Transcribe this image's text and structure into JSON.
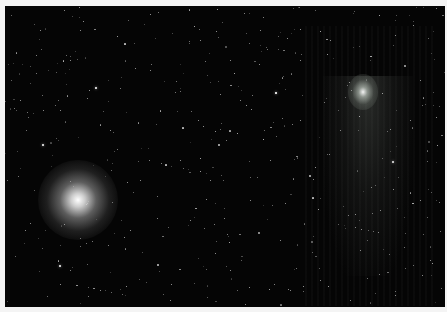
{
  "image": {
    "subject": "Starfield astrophotograph",
    "objects": [
      {
        "name": "globular-cluster",
        "x": 78,
        "y": 200,
        "radius": 34
      },
      {
        "name": "comet",
        "x": 363,
        "y": 88,
        "tail_direction": "down"
      }
    ],
    "colors": {
      "sky": "#050505",
      "frame": "#f4f4f4",
      "star": "#ffffff"
    }
  },
  "stars": [
    [
      43,
      145,
      2.2
    ],
    [
      60,
      266,
      2.2
    ],
    [
      96,
      88,
      1.8
    ],
    [
      276,
      93,
      1.6
    ],
    [
      219,
      145,
      1.4
    ],
    [
      183,
      128,
      1.2
    ],
    [
      310,
      176,
      1.4
    ],
    [
      393,
      162,
      2
    ],
    [
      313,
      198,
      1.2
    ],
    [
      158,
      265,
      1.4
    ],
    [
      125,
      44,
      1.1
    ],
    [
      40,
      30,
      1
    ],
    [
      70,
      60,
      1
    ],
    [
      150,
      70,
      1
    ],
    [
      200,
      40,
      1
    ],
    [
      260,
      30,
      1
    ],
    [
      300,
      60,
      1
    ],
    [
      330,
      40,
      1
    ],
    [
      395,
      35,
      1
    ],
    [
      420,
      80,
      1
    ],
    [
      410,
      120,
      1
    ],
    [
      380,
      210,
      1
    ],
    [
      360,
      250,
      1
    ],
    [
      320,
      280,
      1
    ],
    [
      280,
      240,
      1
    ],
    [
      250,
      200,
      1
    ],
    [
      230,
      270,
      1
    ],
    [
      190,
      220,
      1
    ],
    [
      140,
      180,
      1
    ],
    [
      110,
      130,
      1
    ],
    [
      20,
      100,
      1
    ],
    [
      25,
      230,
      1
    ],
    [
      100,
      290,
      1
    ],
    [
      170,
      300,
      1
    ],
    [
      240,
      100,
      1
    ],
    [
      270,
      160,
      1
    ],
    [
      340,
      130,
      1
    ],
    [
      420,
      200,
      1
    ],
    [
      430,
      260,
      1
    ],
    [
      395,
      295,
      1
    ],
    [
      350,
      300,
      1
    ],
    [
      300,
      120,
      1
    ],
    [
      210,
      180,
      1
    ],
    [
      160,
      110,
      1
    ],
    [
      60,
      110,
      1
    ],
    [
      80,
      30,
      1
    ],
    [
      230,
      60,
      1
    ],
    [
      290,
      290,
      1
    ],
    [
      130,
      230,
      1
    ],
    [
      180,
      160,
      1
    ]
  ]
}
